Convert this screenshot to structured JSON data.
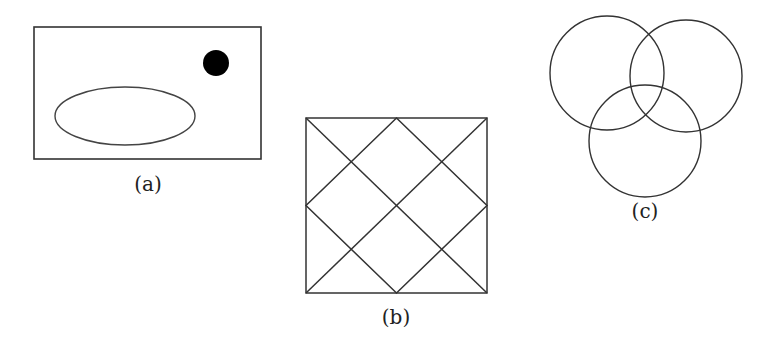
{
  "figures": {
    "a": {
      "label": "(a)",
      "rect": {
        "x": 34,
        "y": 27,
        "w": 227,
        "h": 132
      },
      "ellipse": {
        "cx": 125,
        "cy": 116,
        "rx": 70,
        "ry": 29
      },
      "dot": {
        "cx": 216,
        "cy": 63,
        "r": 13
      }
    },
    "b": {
      "label": "(b)",
      "square": {
        "x": 306,
        "y": 118,
        "w": 181,
        "h": 175
      }
    },
    "c": {
      "label": "(c)",
      "circles": [
        {
          "cx": 607,
          "cy": 73,
          "r": 57
        },
        {
          "cx": 686,
          "cy": 76,
          "r": 56
        },
        {
          "cx": 645,
          "cy": 141,
          "r": 56
        }
      ]
    }
  },
  "colors": {
    "stroke": "#333333",
    "fill_dot": "#000000",
    "background": "#ffffff"
  }
}
